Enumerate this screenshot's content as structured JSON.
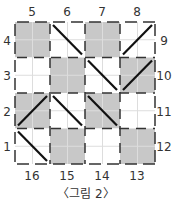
{
  "figure": {
    "caption": "〈그림 2〉",
    "grid": {
      "rows": 4,
      "cols": 4,
      "shade_color": "#c8c8c8",
      "line_color": "#333333",
      "subgrid_color": "#dddddd",
      "cells": [
        [
          {
            "shaded": true,
            "diag": ""
          },
          {
            "shaded": false,
            "diag": "\\"
          },
          {
            "shaded": true,
            "diag": ""
          },
          {
            "shaded": false,
            "diag": "/"
          }
        ],
        [
          {
            "shaded": false,
            "diag": ""
          },
          {
            "shaded": true,
            "diag": ""
          },
          {
            "shaded": false,
            "diag": "\\"
          },
          {
            "shaded": true,
            "diag": "/"
          }
        ],
        [
          {
            "shaded": true,
            "diag": "/"
          },
          {
            "shaded": false,
            "diag": "\\"
          },
          {
            "shaded": true,
            "diag": "\\"
          },
          {
            "shaded": false,
            "diag": ""
          }
        ],
        [
          {
            "shaded": false,
            "diag": "\\"
          },
          {
            "shaded": true,
            "diag": ""
          },
          {
            "shaded": false,
            "diag": ""
          },
          {
            "shaded": true,
            "diag": ""
          }
        ]
      ]
    },
    "labels": {
      "top": [
        "5",
        "6",
        "7",
        "8"
      ],
      "right": [
        "9",
        "10",
        "11",
        "12"
      ],
      "bottom": [
        "16",
        "15",
        "14",
        "13"
      ],
      "left": [
        "4",
        "3",
        "2",
        "1"
      ]
    }
  }
}
